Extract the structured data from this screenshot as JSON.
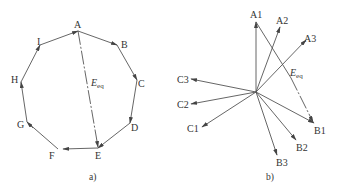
{
  "figure": {
    "panel_a": {
      "caption": "a)",
      "vertices": [
        "A",
        "B",
        "C",
        "D",
        "E",
        "F",
        "G",
        "H",
        "I"
      ],
      "resultant_label": "E",
      "resultant_subscript": "eq",
      "resultant_from": "A",
      "resultant_to": "E"
    },
    "panel_b": {
      "caption": "b)",
      "phasors": [
        "A1",
        "A2",
        "A3",
        "B1",
        "B2",
        "B3",
        "C1",
        "C2",
        "C3"
      ],
      "resultant_label": "E",
      "resultant_subscript": "eq",
      "resultant_from": "A1",
      "resultant_to": "B1"
    },
    "colors": {
      "line": "#555555",
      "text": "#333333",
      "background": "#ffffff"
    }
  }
}
